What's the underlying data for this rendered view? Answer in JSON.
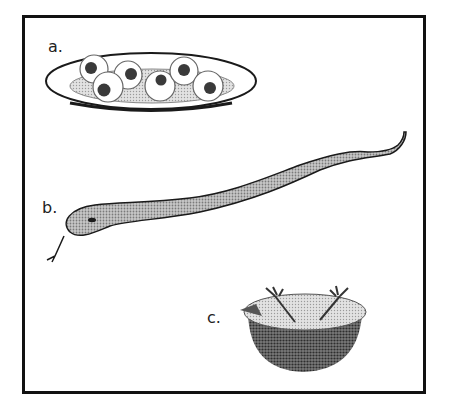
{
  "figure": {
    "panels": [
      {
        "id": "a",
        "label": "a.",
        "subject": "plate of eyeballs",
        "item_count": 6
      },
      {
        "id": "b",
        "label": "b.",
        "subject": "snake"
      },
      {
        "id": "c",
        "label": "c.",
        "subject": "bowl with chicken feet"
      }
    ],
    "colors": {
      "frame": "#111111",
      "ink": "#1a1a1a",
      "plate_fill": "#ffffff",
      "snake_fill": "#a8a8a8",
      "bowl_body": "#5a5a5a",
      "bowl_top": "#b5b5b5",
      "pupil": "#3a3a3a"
    }
  }
}
